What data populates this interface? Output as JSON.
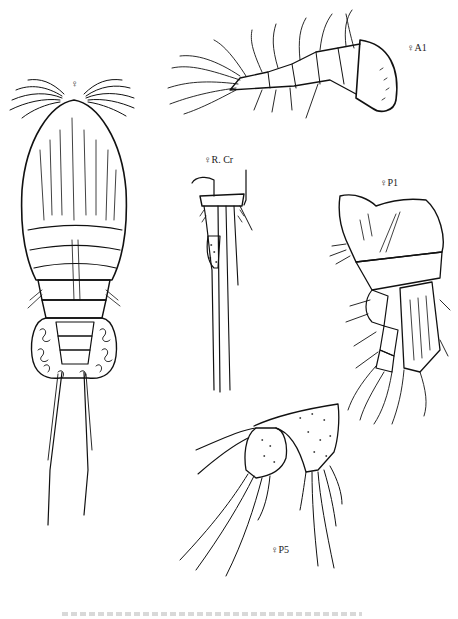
{
  "figure": {
    "background": "#ffffff",
    "ink_color": "#111111",
    "panels": [
      {
        "id": "habitus",
        "label": "♀",
        "description": "Female habitus, dorsal view"
      },
      {
        "id": "a1",
        "label": "♀A1",
        "description": "Female antennule"
      },
      {
        "id": "rcr",
        "label": "♀R. Cr",
        "description": "Female right caudal ramus"
      },
      {
        "id": "p1",
        "label": "♀P1",
        "description": "Female leg 1"
      },
      {
        "id": "p5",
        "label": "♀P5",
        "description": "Female leg 5"
      }
    ],
    "caption": ""
  }
}
